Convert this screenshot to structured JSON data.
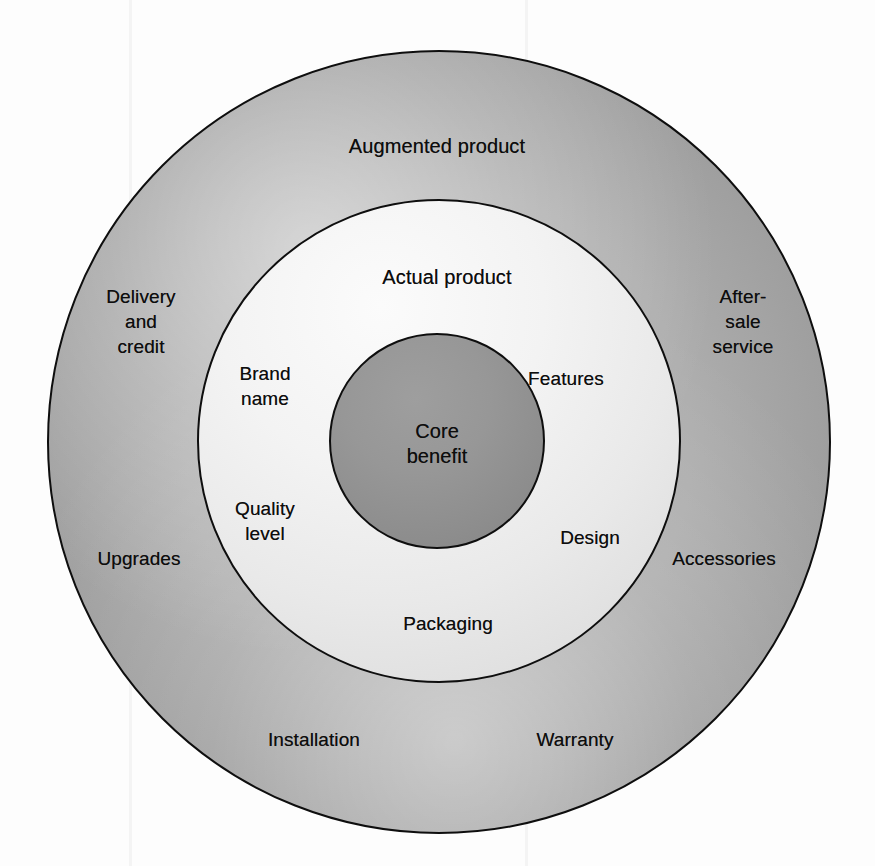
{
  "diagram": {
    "type": "concentric-circles",
    "title_visible": false,
    "background_color": "#fdfdfd",
    "rings": [
      {
        "id": "augmented",
        "label": "Augmented product",
        "label_x": 437,
        "label_y": 146,
        "fill_color": "#a9a9a9",
        "stroke_color": "#0e0e0e",
        "center_x": 439,
        "center_y": 442,
        "radius": 392
      },
      {
        "id": "actual",
        "label": "Actual product",
        "label_x": 447,
        "label_y": 277,
        "fill_color": "#eaeaea",
        "stroke_color": "#0e0e0e",
        "center_x": 439,
        "center_y": 441,
        "radius": 242
      },
      {
        "id": "core",
        "label": "Core\nbenefit",
        "label_x": 437,
        "label_y": 444,
        "fill_color": "#919191",
        "stroke_color": "#0e0e0e",
        "center_x": 437,
        "center_y": 441,
        "radius": 108
      }
    ],
    "augmented_items": [
      {
        "id": "delivery-and-credit",
        "label": "Delivery\nand\ncredit",
        "x": 141,
        "y": 321
      },
      {
        "id": "after-sale-service",
        "label": "After-\nsale\nservice",
        "x": 743,
        "y": 321
      },
      {
        "id": "upgrades",
        "label": "Upgrades",
        "x": 139,
        "y": 558
      },
      {
        "id": "accessories",
        "label": "Accessories",
        "x": 724,
        "y": 558
      },
      {
        "id": "installation",
        "label": "Installation",
        "x": 314,
        "y": 739
      },
      {
        "id": "warranty",
        "label": "Warranty",
        "x": 575,
        "y": 739
      }
    ],
    "actual_items": [
      {
        "id": "brand-name",
        "label": "Brand\nname",
        "x": 265,
        "y": 386
      },
      {
        "id": "features",
        "label": "Features",
        "x": 566,
        "y": 378
      },
      {
        "id": "quality-level",
        "label": "Quality\nlevel",
        "x": 265,
        "y": 521
      },
      {
        "id": "design",
        "label": "Design",
        "x": 590,
        "y": 537
      },
      {
        "id": "packaging",
        "label": "Packaging",
        "x": 448,
        "y": 623
      }
    ]
  }
}
